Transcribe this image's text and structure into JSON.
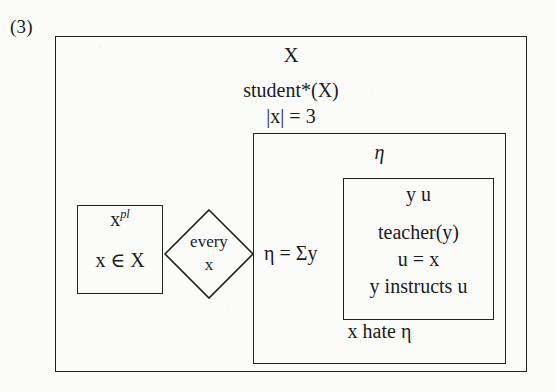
{
  "figure": {
    "number": "(3)",
    "type": "discourse-representation-structure"
  },
  "outer_drs": {
    "universe": "X",
    "conditions": [
      "student*(X)",
      "|x| = 3"
    ]
  },
  "left_drs": {
    "universe_prefix": "x",
    "universe_superscript": "pl",
    "condition": "x ∈ X"
  },
  "quantifier_diamond": {
    "line1": "every",
    "line2": "x"
  },
  "middle_drs": {
    "universe": "η",
    "sum_equation": "η = Σy",
    "bottom_condition": "x hate η"
  },
  "inner_drs": {
    "universe": "y  u",
    "conditions": [
      "teacher(y)",
      "u = x",
      "y instructs u"
    ]
  },
  "colors": {
    "ink": "#202020",
    "paper": "#fbfbfa"
  }
}
